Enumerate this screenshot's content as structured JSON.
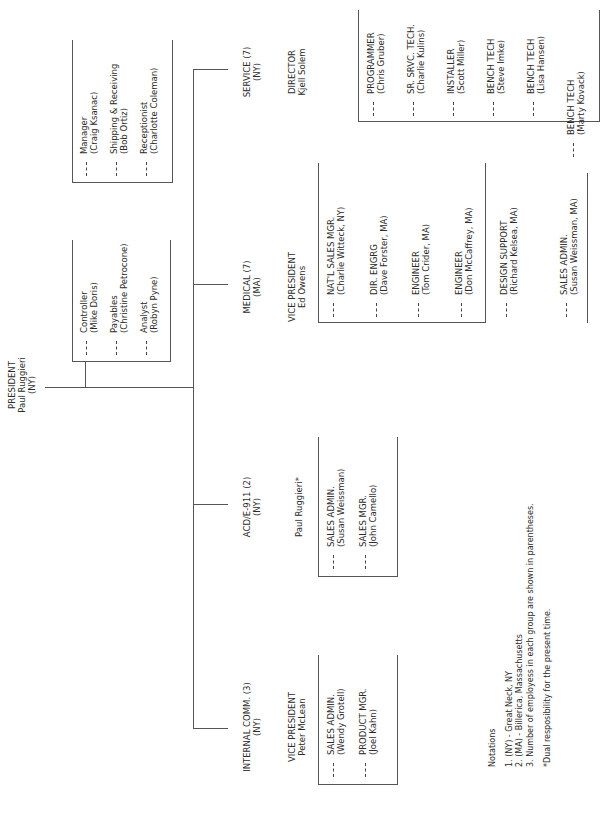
{
  "president": {
    "title": "PRESIDENT",
    "name": "Paul Ruggieri",
    "location": "(NY)"
  },
  "admin": {
    "box1": [
      {
        "role": "Controller",
        "person": "(Mike Doris)"
      },
      {
        "role": "Payables",
        "person": "(Christine Petrocone)"
      },
      {
        "role": "Analyst",
        "person": "(Robyn Pyne)"
      }
    ],
    "box2": [
      {
        "role": "Manager",
        "person": "(Craig Ksanac)"
      },
      {
        "role": "Shipping & Receiving",
        "person": "(Bob Ortiz)"
      },
      {
        "role": "Receptionist",
        "person": "(Charlotte Coleman)"
      }
    ]
  },
  "divisions": {
    "internal": {
      "name": "INTERNAL COMM.  (3)",
      "location": "(NY)",
      "head_title": "VICE PRESIDENT",
      "head_name": "Peter McLean",
      "staff": [
        {
          "role": "SALES ADMIN.",
          "person": "(Wendy Grotell)"
        },
        {
          "role": "PRODUCT MGR.",
          "person": "(Joel Kahn)"
        }
      ]
    },
    "acd": {
      "name": "ACD/E-911  (2)",
      "location": "(NY)",
      "head_name": "Paul Ruggieri*",
      "staff": [
        {
          "role": "SALES ADMIN.",
          "person": "(Susan Weissman)"
        },
        {
          "role": "SALES MGR.",
          "person": "(John Camello)"
        }
      ]
    },
    "medical": {
      "name": "MEDICAL  (7)",
      "location": "(MA)",
      "head_title": "VICE PRESIDENT",
      "head_name": "Ed Owens",
      "staff": [
        {
          "role": "NAT'L SALES MGR.",
          "person": "(Charlie Witteck, NY)"
        },
        {
          "role": "DIR. ENGRG",
          "person": "(Dave Forster, MA)"
        },
        {
          "role": "ENGINEER",
          "person": "(Tom Crider, MA)"
        },
        {
          "role": "ENGINEER",
          "person": "(Don McCaffrey, MA)"
        },
        {
          "role": "DESIGN SUPPORT",
          "person": "(Richard Kelsea, MA)"
        },
        {
          "role": "SALES ADMIN.",
          "person": "(Susan Weissman, MA)"
        }
      ]
    },
    "service": {
      "name": "SERVICE  (7)",
      "location": "(NY)",
      "head_title": "DIRECTOR",
      "head_name": "Kjell Solem",
      "staff": [
        {
          "role": "PROGRAMMER",
          "person": "(Chris Gruber)"
        },
        {
          "role": "SR. SRVC. TECH.",
          "person": "(Charlie Kulins)"
        },
        {
          "role": "INSTALLER",
          "person": "(Scott Miller)"
        },
        {
          "role": "BENCH TECH",
          "person": "(Steve Imke)"
        },
        {
          "role": "BENCH TECH",
          "person": "(Lisa Hansen)"
        },
        {
          "role": "BENCH TECH",
          "person": "(Marty Kovack)"
        }
      ]
    }
  },
  "notations": {
    "title": "Notations",
    "items": [
      "1. (NY) - Great Neck, NY",
      "2. (MA) - Billerica, Massachusetts",
      "3. Number of employess in each group are shown in parentheses."
    ],
    "footnote": "*Dual resposibility for the present time."
  }
}
